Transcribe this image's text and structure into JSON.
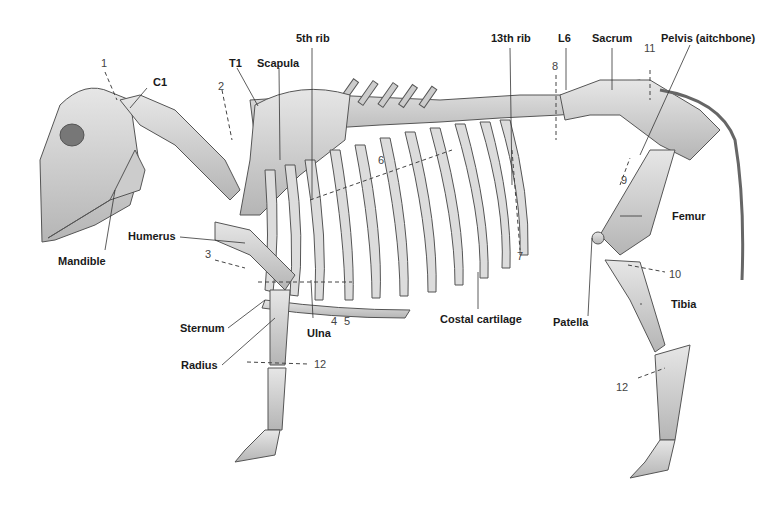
{
  "figure": {
    "colors": {
      "bone": "#d9d9d9",
      "bone_shade": "#a8a8a8",
      "outline": "#555555",
      "leader": "#333333",
      "background": "#ffffff"
    }
  },
  "labels": {
    "c1": "C1",
    "t1": "T1",
    "scapula": "Scapula",
    "rib5": "5th rib",
    "rib13": "13th rib",
    "l6": "L6",
    "sacrum": "Sacrum",
    "pelvis": "Pelvis (aitchbone)",
    "mandible": "Mandible",
    "humerus": "Humerus",
    "sternum": "Sternum",
    "radius": "Radius",
    "ulna": "Ulna",
    "costal": "Costal cartilage",
    "patella": "Patella",
    "femur": "Femur",
    "tibia": "Tibia"
  },
  "numbers": {
    "n1": "1",
    "n2": "2",
    "n3": "3",
    "n4": "4",
    "n5": "5",
    "n6": "6",
    "n7": "7",
    "n8": "8",
    "n9": "9",
    "n10": "10",
    "n11": "11",
    "n12_front": "12",
    "n12_hind": "12"
  }
}
